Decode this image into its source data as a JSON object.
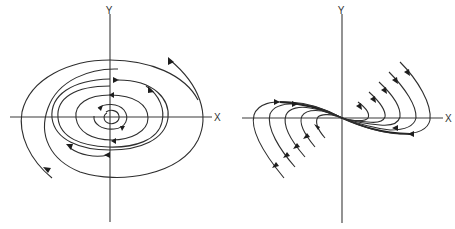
{
  "figure": {
    "panels": [
      {
        "name": "spiral-phase-portrait",
        "type": "stable spiral (focus)",
        "x_axis_label": "X",
        "y_axis_label": "Y"
      },
      {
        "name": "node-phase-portrait",
        "type": "degenerate/improper node",
        "x_axis_label": "X",
        "y_axis_label": "Y"
      }
    ]
  }
}
